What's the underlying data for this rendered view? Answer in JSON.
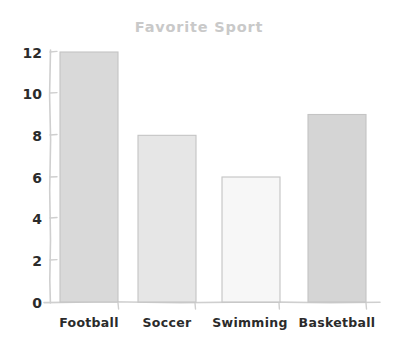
{
  "chart_data": {
    "type": "bar",
    "title": "Favorite Sport",
    "xlabel": "",
    "ylabel": "",
    "categories": [
      "Football",
      "Soccer",
      "Swimming",
      "Basketball"
    ],
    "values": [
      12,
      8,
      6,
      9
    ],
    "ylim": [
      0,
      12
    ],
    "yticks": [
      0,
      2,
      4,
      6,
      8,
      10,
      12
    ],
    "ytick_labels": [
      "0",
      "2",
      "4",
      "6",
      "8",
      "10",
      "12"
    ],
    "grid": false,
    "legend": null,
    "style": "hand-drawn",
    "bar_colors": [
      "#d9d9d9",
      "#e6e6e6",
      "#f7f7f7",
      "#d5d5d5"
    ],
    "bar_edge_color": "#c4c4c4",
    "axis_color": "#cfcfcf",
    "title_color": "#c9c9c9",
    "tick_label_color": "#2b2b2b",
    "background_color": "#ffffff"
  }
}
